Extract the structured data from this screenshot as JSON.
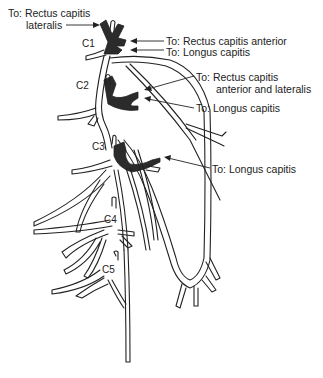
{
  "diagram": {
    "segments": [
      "C1",
      "C2",
      "C3",
      "C4",
      "C5"
    ],
    "labels": {
      "c1_lateralis_line1": "To: Rectus capitis",
      "c1_lateralis_line2": "lateralis",
      "c1_anterior": "To: Rectus capitis anterior",
      "c1_longus": "To: Longus capitis",
      "c2_rect_line1": "To: Rectus capitis",
      "c2_rect_line2": "anterior and lateralis",
      "c2_longus": "To: Longus capitis",
      "c3_longus": "To: Longus capitis"
    },
    "colors": {
      "line": "#222222",
      "muscle_branch_fill": "#2b2b2b",
      "background": "#ffffff"
    }
  }
}
